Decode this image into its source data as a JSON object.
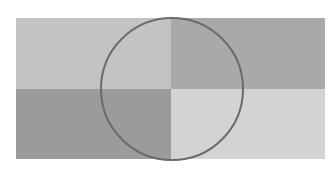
{
  "diagram": {
    "type": "quadrant-rectangle-with-circle",
    "canvas": {
      "width": 333,
      "height": 170,
      "background": "#ffffff"
    },
    "rectangle": {
      "x": 16,
      "y": 18,
      "width": 309,
      "height": 141
    },
    "split": {
      "x": 171,
      "y": 89
    },
    "quadrants": [
      {
        "id": "top-left",
        "color": "#c3c3c3"
      },
      {
        "id": "top-right",
        "color": "#a9a9a9"
      },
      {
        "id": "bottom-left",
        "color": "#9b9b9b"
      },
      {
        "id": "bottom-right",
        "color": "#d3d3d3"
      }
    ],
    "circle": {
      "cx": 172,
      "cy": 89,
      "r": 71,
      "stroke": "#6b6b6b",
      "stroke_width": 2,
      "fill": "none"
    }
  }
}
